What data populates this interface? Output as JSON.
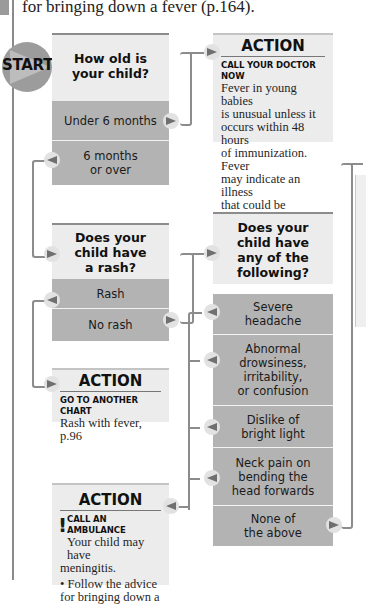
{
  "intro_text": "for bringing down a fever (p.164).",
  "start": {
    "label": "START"
  },
  "q1": {
    "title": "How old is your child?",
    "title_lines": [
      "How old is",
      "your child?"
    ],
    "options": [
      {
        "label": "Under 6 months",
        "lines": [
          "Under 6 months"
        ],
        "next": "action1",
        "arrow": "right"
      },
      {
        "label": "6 months or over",
        "lines": [
          "6 months",
          "or over"
        ],
        "next": "q2",
        "arrow": "left"
      }
    ]
  },
  "action1": {
    "heading": "ACTION",
    "caption": "CALL YOUR DOCTOR NOW",
    "body_lines": [
      "Fever in young babies",
      "is unusual unless it",
      "occurs within 48 hours",
      "of immunization. Fever",
      "may indicate an illness",
      "that could be serious."
    ]
  },
  "q2": {
    "title": "Does your child have a rash?",
    "title_lines": [
      "Does your",
      "child have",
      "a rash?"
    ],
    "options": [
      {
        "label": "Rash",
        "lines": [
          "Rash"
        ],
        "next": "action2",
        "arrow": "left"
      },
      {
        "label": "No rash",
        "lines": [
          "No rash"
        ],
        "next": "q3",
        "arrow": "right"
      }
    ]
  },
  "action2": {
    "heading": "ACTION",
    "caption": "GO TO ANOTHER CHART",
    "body_lines": [
      "Rash with fever, p.96"
    ]
  },
  "q3": {
    "title": "Does your child have any of the following?",
    "title_lines": [
      "Does your",
      "child have",
      "any of the",
      "following?"
    ],
    "options": [
      {
        "label": "Severe headache",
        "lines": [
          "Severe",
          "headache"
        ],
        "next": "action3",
        "arrow": "left"
      },
      {
        "label": "Abnormal drowsiness, irritability, or confusion",
        "lines": [
          "Abnormal",
          "drowsiness,",
          "irritability,",
          "or confusion"
        ],
        "next": "action3",
        "arrow": "left"
      },
      {
        "label": "Dislike of bright light",
        "lines": [
          "Dislike of",
          "bright light"
        ],
        "next": "action3",
        "arrow": "left"
      },
      {
        "label": "Neck pain on bending the head forwards",
        "lines": [
          "Neck pain on",
          "bending the",
          "head forwards"
        ],
        "next": "action3",
        "arrow": "left"
      },
      {
        "label": "None of the above",
        "lines": [
          "None of",
          "the above"
        ],
        "next": "offscreen-right",
        "arrow": "right"
      }
    ]
  },
  "action3": {
    "heading": "ACTION",
    "caption": "CALL AN AMBULANCE",
    "warning_glyph": "!",
    "body_lines": [
      "Your child may have",
      "meningitis."
    ],
    "bullet_lines": [
      "Follow the advice",
      "for bringing down a"
    ],
    "bullet_glyph": "•"
  },
  "colors": {
    "question_header_bg": "#ececec",
    "option_bg": "#b3b3b3",
    "connector": "#8c8c8c",
    "start_circle": "#9c9c9c",
    "text": "#111111"
  }
}
